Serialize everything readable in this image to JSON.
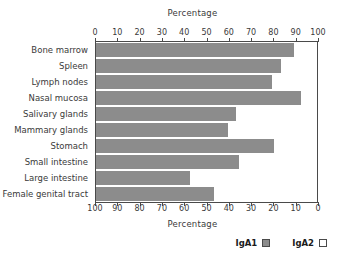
{
  "chart_data": {
    "type": "bar",
    "orientation": "horizontal",
    "stacked": true,
    "title": "",
    "xlabel": "Percentage",
    "ylabel": "",
    "top_axis_label": "Percentage",
    "bottom_axis_label": "Percentage",
    "xlim": [
      0,
      100
    ],
    "grid": false,
    "legend_position": "bottom-right",
    "top_axis_ticks": [
      0,
      10,
      20,
      30,
      40,
      50,
      60,
      70,
      80,
      90,
      100
    ],
    "bottom_axis_ticks": [
      100,
      90,
      80,
      70,
      60,
      50,
      40,
      30,
      20,
      10,
      0
    ],
    "categories": [
      "Bone marrow",
      "Spleen",
      "Lymph nodes",
      "Nasal mucosa",
      "Salivary glands",
      "Mammary glands",
      "Stomach",
      "Small intestine",
      "Large intestine",
      "Female genital tract"
    ],
    "series": [
      {
        "name": "IgA1",
        "color": "#8c8c8c",
        "values": [
          90,
          84,
          80,
          93,
          64,
          60,
          81,
          65,
          43,
          54
        ]
      },
      {
        "name": "IgA2",
        "color": "#ffffff",
        "values": [
          10,
          16,
          20,
          7,
          36,
          40,
          19,
          35,
          57,
          46
        ]
      }
    ],
    "legend": [
      {
        "label": "IgA1",
        "color": "#8c8c8c"
      },
      {
        "label": "IgA2",
        "color": "#ffffff"
      }
    ]
  },
  "colors": {
    "iga1": "#8c8c8c",
    "iga2": "#ffffff",
    "axis": "#4a4a4a",
    "text": "#3a3a3a",
    "background": "#ffffff"
  }
}
